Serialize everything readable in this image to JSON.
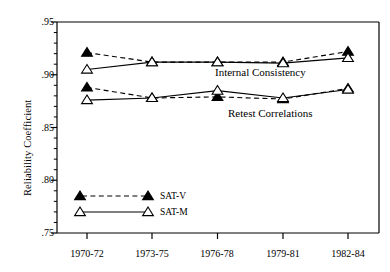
{
  "chart_data": {
    "type": "line",
    "title": "",
    "xlabel": "",
    "ylabel": "Reliability Coefficient",
    "categories": [
      "1970-72",
      "1973-75",
      "1976-78",
      "1979-81",
      "1982-84"
    ],
    "ylim": [
      0.75,
      0.95
    ],
    "ytick_labels": [
      ".95",
      ".90",
      ".85",
      ".80",
      ".75"
    ],
    "ytick_values": [
      0.95,
      0.9,
      0.85,
      0.8,
      0.75
    ],
    "yminor_step": 0.01,
    "grid": false,
    "legend_position": "lower-left-inside",
    "annotations": [
      {
        "text": "Internal Consistency",
        "x": 0.915,
        "y": 0.899
      },
      {
        "text": "Retest Correlations",
        "x": 0.905,
        "y": 0.861
      }
    ],
    "groups": [
      {
        "name": "Internal Consistency",
        "series": [
          {
            "name": "SAT-V",
            "marker": "filled-triangle",
            "line": "dashed",
            "values": [
              0.921,
              0.912,
              0.912,
              0.912,
              0.922
            ]
          },
          {
            "name": "SAT-M",
            "marker": "open-triangle",
            "line": "solid",
            "values": [
              0.905,
              0.912,
              0.912,
              0.911,
              0.916
            ]
          }
        ]
      },
      {
        "name": "Retest Correlations",
        "series": [
          {
            "name": "SAT-V",
            "marker": "filled-triangle",
            "line": "dashed",
            "values": [
              0.888,
              0.878,
              0.879,
              0.877,
              0.887
            ]
          },
          {
            "name": "SAT-M",
            "marker": "open-triangle",
            "line": "solid",
            "values": [
              0.876,
              0.878,
              0.885,
              0.878,
              0.886
            ]
          }
        ]
      }
    ],
    "legend": [
      {
        "label": "SAT-V",
        "marker": "filled-triangle",
        "line": "dashed"
      },
      {
        "label": "SAT-M",
        "marker": "open-triangle",
        "line": "solid"
      }
    ],
    "colors": {
      "ink": "#000000",
      "background": "#ffffff"
    }
  }
}
